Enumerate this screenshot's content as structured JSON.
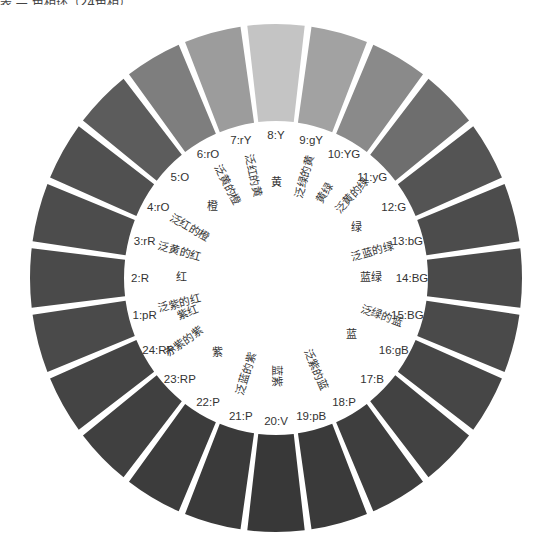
{
  "caption": "表 — 色相环（24色相）",
  "wheel": {
    "center": [
      276,
      278
    ],
    "outer_radius": [
      246,
      254
    ],
    "inner_radius": [
      152,
      157
    ],
    "segments": [
      {
        "code": "1:pR",
        "gray": "#4a4a4a"
      },
      {
        "code": "2:R",
        "gray": "#4a4a4a"
      },
      {
        "code": "3:rR",
        "gray": "#4c4c4c"
      },
      {
        "code": "4:rO",
        "gray": "#505050"
      },
      {
        "code": "5:O",
        "gray": "#5c5c5c"
      },
      {
        "code": "6:rO",
        "gray": "#7e7e7e"
      },
      {
        "code": "7:rY",
        "gray": "#9c9c9c"
      },
      {
        "code": "8:Y",
        "gray": "#c4c4c4"
      },
      {
        "code": "9:gY",
        "gray": "#a2a2a2"
      },
      {
        "code": "10:YG",
        "gray": "#8a8a8a"
      },
      {
        "code": "11:yG",
        "gray": "#6e6e6e"
      },
      {
        "code": "12:G",
        "gray": "#545454"
      },
      {
        "code": "13:bG",
        "gray": "#4c4c4c"
      },
      {
        "code": "14:BG",
        "gray": "#4a4a4a"
      },
      {
        "code": "15:BG",
        "gray": "#4a4a4a"
      },
      {
        "code": "16:gB",
        "gray": "#464646"
      },
      {
        "code": "17:B",
        "gray": "#424242"
      },
      {
        "code": "18:P",
        "gray": "#3e3e3e"
      },
      {
        "code": "19:pB",
        "gray": "#3a3a3a"
      },
      {
        "code": "20:V",
        "gray": "#383838"
      },
      {
        "code": "21:P",
        "gray": "#3a3a3a"
      },
      {
        "code": "22:P",
        "gray": "#3c3c3c"
      },
      {
        "code": "23:RP",
        "gray": "#404040"
      },
      {
        "code": "24:RP",
        "gray": "#444444"
      }
    ],
    "inner_labels": [
      {
        "text": "泛紫的红",
        "angle": 195,
        "r": 100
      },
      {
        "text": "红",
        "angle": 180,
        "r": 95
      },
      {
        "text": "泛黄的红",
        "angle": 165,
        "r": 100
      },
      {
        "text": "泛红的橙",
        "angle": 150,
        "r": 100
      },
      {
        "text": "橙",
        "angle": 132,
        "r": 95
      },
      {
        "text": "泛黄的橙",
        "angle": 118,
        "r": 105
      },
      {
        "text": "泛红的黄",
        "angle": 103,
        "r": 105
      },
      {
        "text": "黄",
        "angle": 90,
        "r": 95
      },
      {
        "text": "泛绿的黄",
        "angle": 74,
        "r": 105
      },
      {
        "text": "黄绿",
        "angle": 60,
        "r": 98
      },
      {
        "text": "泛黄的绿",
        "angle": 47,
        "r": 112
      },
      {
        "text": "绿",
        "angle": 32,
        "r": 95
      },
      {
        "text": "泛蓝的绿",
        "angle": 15,
        "r": 100
      },
      {
        "text": "蓝绿",
        "angle": 0,
        "r": 95
      },
      {
        "text": "泛绿的蓝",
        "angle": -20,
        "r": 112
      },
      {
        "text": "蓝",
        "angle": -37,
        "r": 95
      },
      {
        "text": "泛紫的蓝",
        "angle": -67,
        "r": 100
      },
      {
        "text": "蓝紫",
        "angle": -90,
        "r": 98
      },
      {
        "text": "泛蓝的紫",
        "angle": -107,
        "r": 100
      },
      {
        "text": "紫",
        "angle": -128,
        "r": 95
      },
      {
        "text": "赤紫的紫",
        "angle": -145,
        "r": 112
      },
      {
        "text": "紫红",
        "angle": -158,
        "r": 95
      }
    ]
  }
}
